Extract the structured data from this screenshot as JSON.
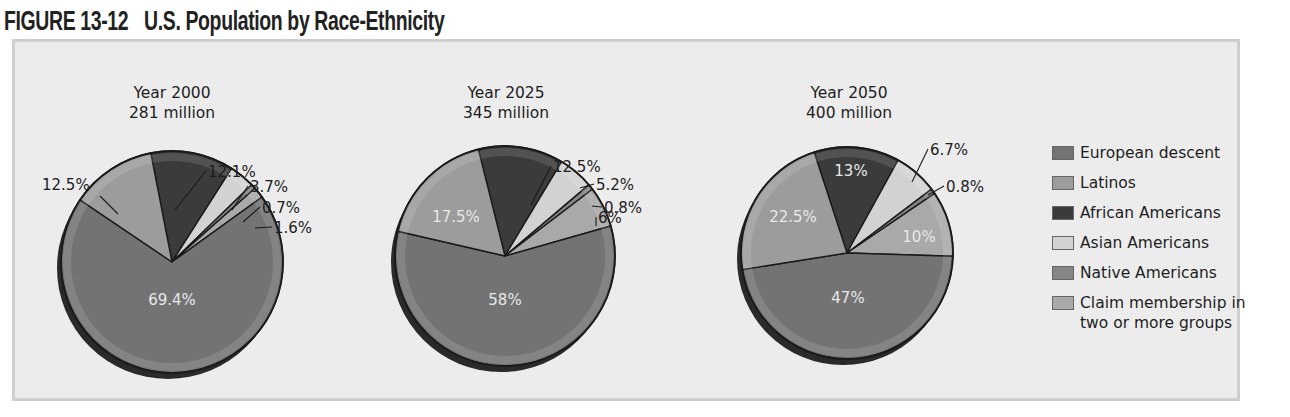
{
  "figure": {
    "number": "FIGURE 13-12",
    "title": "U.S. Population by Race-Ethnicity"
  },
  "legend": {
    "items": [
      {
        "label": "European descent",
        "color": "#737373"
      },
      {
        "label": "Latinos",
        "color": "#9c9c9c"
      },
      {
        "label": "African Americans",
        "color": "#3b3b3b"
      },
      {
        "label": "Asian Americans",
        "color": "#d2d2d2"
      },
      {
        "label": "Native Americans",
        "color": "#858585"
      },
      {
        "label": "Claim membership in\ntwo or more groups",
        "color": "#a9a9a9"
      }
    ]
  },
  "pies": [
    {
      "year_label": "Year 2000",
      "total_label": "281 million"
    },
    {
      "year_label": "Year 2025",
      "total_label": "345 million"
    },
    {
      "year_label": "Year 2050",
      "total_label": "400 million"
    }
  ],
  "chart_data": {
    "type": "pie",
    "title": "U.S. Population by Race-Ethnicity",
    "figure_number": "FIGURE 13-12",
    "categories": [
      "European descent",
      "Latinos",
      "African Americans",
      "Asian Americans",
      "Native Americans",
      "Claim membership in two or more groups"
    ],
    "legend_position": "right",
    "charts": [
      {
        "title": "Year 2000",
        "subtitle": "281 million",
        "values": [
          69.4,
          12.5,
          12.1,
          3.7,
          0.7,
          1.6
        ],
        "labels": [
          "69.4%",
          "12.5%",
          "12.1%",
          "3.7%",
          "0.7%",
          "1.6%"
        ]
      },
      {
        "title": "Year 2025",
        "subtitle": "345 million",
        "values": [
          58,
          17.5,
          12.5,
          5.2,
          0.8,
          6
        ],
        "labels": [
          "58%",
          "17.5%",
          "12.5%",
          "5.2%",
          "0.8%",
          "6%"
        ]
      },
      {
        "title": "Year 2050",
        "subtitle": "400 million",
        "values": [
          47,
          22.5,
          13,
          6.7,
          0.8,
          10
        ],
        "labels": [
          "47%",
          "22.5%",
          "13%",
          "6.7%",
          "0.8%",
          "10%"
        ]
      }
    ]
  }
}
